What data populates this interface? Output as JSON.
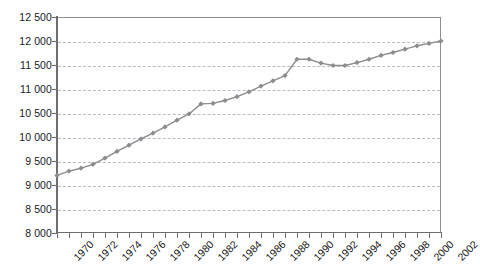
{
  "chart_data": {
    "type": "line",
    "title": "",
    "subtitle": "",
    "xlabel": "",
    "ylabel": "",
    "xlim": [
      1970,
      2002
    ],
    "ylim": [
      8000,
      12500
    ],
    "y_tick_step": 500,
    "x_tick_step": 1,
    "x_label_step": 2,
    "grid": true,
    "grid_style": "dashed-horizontal",
    "legend": "none",
    "marker": "diamond",
    "thousands_separator": " ",
    "y_ticks": [
      8000,
      8500,
      9000,
      9500,
      10000,
      10500,
      11000,
      11500,
      12000,
      12500
    ],
    "y_tick_labels": [
      "8 000",
      "8 500",
      "9 000",
      "9 500",
      "10 000",
      "10 500",
      "11 000",
      "11 500",
      "12 000",
      "12 500"
    ],
    "x_ticks": [
      1970,
      1971,
      1972,
      1973,
      1974,
      1975,
      1976,
      1977,
      1978,
      1979,
      1980,
      1981,
      1982,
      1983,
      1984,
      1985,
      1986,
      1987,
      1988,
      1989,
      1990,
      1991,
      1992,
      1993,
      1994,
      1995,
      1996,
      1997,
      1998,
      1999,
      2000,
      2001,
      2002
    ],
    "x_tick_labels": [
      "1970",
      "1972",
      "1974",
      "1976",
      "1978",
      "1980",
      "1982",
      "1984",
      "1986",
      "1988",
      "1990",
      "1992",
      "1994",
      "1996",
      "1998",
      "2000",
      "2002"
    ],
    "x": [
      1970,
      1971,
      1972,
      1973,
      1974,
      1975,
      1976,
      1977,
      1978,
      1979,
      1980,
      1981,
      1982,
      1983,
      1984,
      1985,
      1986,
      1987,
      1988,
      1989,
      1990,
      1991,
      1992,
      1993,
      1994,
      1995,
      1996,
      1997,
      1998,
      1999,
      2000,
      2001,
      2002
    ],
    "values": [
      9200,
      9290,
      9350,
      9430,
      9560,
      9700,
      9830,
      9960,
      10080,
      10210,
      10350,
      10480,
      10690,
      10700,
      10760,
      10840,
      10940,
      11060,
      11170,
      11280,
      11620,
      11620,
      11540,
      11490,
      11490,
      11550,
      11620,
      11700,
      11760,
      11830,
      11900,
      11950,
      12000
    ],
    "series": [
      {
        "name": "",
        "color": "#8c8c8c",
        "values": [
          9200,
          9290,
          9350,
          9430,
          9560,
          9700,
          9830,
          9960,
          10080,
          10210,
          10350,
          10480,
          10690,
          10700,
          10760,
          10840,
          10940,
          11060,
          11170,
          11280,
          11620,
          11620,
          11540,
          11490,
          11490,
          11550,
          11620,
          11700,
          11760,
          11830,
          11900,
          11950,
          12000
        ]
      }
    ]
  },
  "colors": {
    "series": "#8c8c8c",
    "grid": "#b9b9c9",
    "axis": "#6e6e6e",
    "frame": "#8e8e8e",
    "text": "#1a1a1a",
    "background": "#ffffff"
  }
}
